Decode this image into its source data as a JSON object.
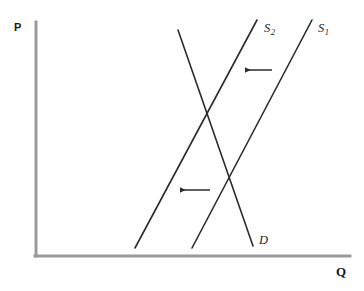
{
  "figure": {
    "type": "supply-demand-diagram",
    "background_color": "#ffffff",
    "axes": {
      "color": "#9a9a9a",
      "stroke_width": 3,
      "y_axis": {
        "x": 36,
        "y_top": 22,
        "y_bottom": 256
      },
      "x_axis": {
        "y": 256,
        "x_left": 36,
        "x_right": 350
      },
      "y_label": "P",
      "x_label": "Q"
    },
    "curve_color": "#2b2b2b",
    "curve_stroke_width": 1.6,
    "curves": [
      {
        "id": "supply-2",
        "label": "S",
        "subscript": "2",
        "role": "supply-shifted",
        "x1": 135,
        "y1": 248,
        "x2": 257,
        "y2": 20,
        "label_x": 264,
        "label_y": 22
      },
      {
        "id": "supply-1",
        "label": "S",
        "subscript": "1",
        "role": "supply-original",
        "x1": 192,
        "y1": 248,
        "x2": 312,
        "y2": 20,
        "label_x": 318,
        "label_y": 22
      },
      {
        "id": "demand",
        "label": "D",
        "subscript": "",
        "role": "demand",
        "x1": 178,
        "y1": 30,
        "x2": 253,
        "y2": 246,
        "label_x": 259,
        "label_y": 234
      }
    ],
    "arrows": [
      {
        "id": "shift-arrow-upper",
        "direction": "left",
        "color": "#2b2b2b",
        "x_start": 272,
        "x_end": 243,
        "y": 70
      },
      {
        "id": "shift-arrow-lower",
        "direction": "left",
        "color": "#2b2b2b",
        "x_start": 210,
        "x_end": 178,
        "y": 190
      }
    ],
    "intersections": [
      {
        "id": "equilibrium-new",
        "curves": [
          "demand",
          "supply-2"
        ],
        "x": 208,
        "y": 118
      },
      {
        "id": "equilibrium-original",
        "curves": [
          "demand",
          "supply-1"
        ],
        "x": 230,
        "y": 175
      }
    ]
  },
  "chart_data": {
    "type": "line",
    "title": "",
    "xlabel": "Q",
    "ylabel": "P",
    "grid": false,
    "legend": "inline-curve-labels",
    "annotations": [
      "leftward shift arrow (upper)",
      "leftward shift arrow (lower)"
    ],
    "series": [
      {
        "name": "S2",
        "points": [
          [
            135,
            248
          ],
          [
            257,
            20
          ]
        ]
      },
      {
        "name": "S1",
        "points": [
          [
            192,
            248
          ],
          [
            312,
            20
          ]
        ]
      },
      {
        "name": "D",
        "points": [
          [
            178,
            30
          ],
          [
            253,
            246
          ]
        ]
      }
    ]
  }
}
